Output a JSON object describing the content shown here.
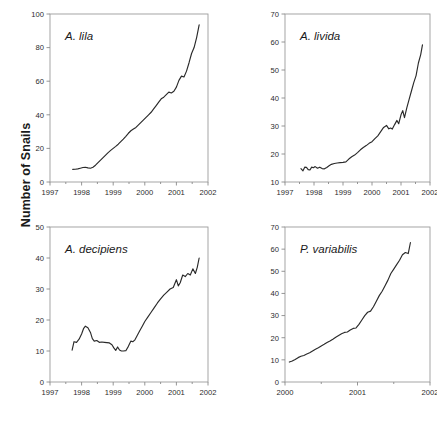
{
  "figure": {
    "shared_y_axis_label": "Number of Snails",
    "background_color": "#ffffff",
    "line_color": "#2a2a2a",
    "frame_color": "#9b9b9b"
  },
  "chart_data": [
    {
      "type": "line",
      "title": "A. lila",
      "panel": "top-left",
      "xlabel": "",
      "ylabel": "Number of Snails",
      "xlim": [
        1997,
        2002
      ],
      "ylim": [
        0,
        100
      ],
      "xticks": [
        1997,
        1998,
        1999,
        2000,
        2001,
        2002
      ],
      "xticklabels": [
        "1997",
        "1998",
        "1999",
        "2000",
        "2001",
        "2002"
      ],
      "yticks": [
        0,
        20,
        40,
        60,
        80,
        100
      ],
      "yticklabels": [
        "0",
        "20",
        "40",
        "60",
        "80",
        "100"
      ],
      "grid": false,
      "legend": "none",
      "x": [
        1997.72,
        1997.8,
        1997.88,
        1997.96,
        1998.04,
        1998.12,
        1998.2,
        1998.28,
        1998.36,
        1998.44,
        1998.52,
        1998.6,
        1998.68,
        1998.76,
        1998.84,
        1998.92,
        1999.0,
        1999.08,
        1999.16,
        1999.24,
        1999.32,
        1999.4,
        1999.48,
        1999.56,
        1999.64,
        1999.72,
        1999.8,
        1999.88,
        1999.96,
        2000.04,
        2000.12,
        2000.2,
        2000.28,
        2000.36,
        2000.44,
        2000.52,
        2000.6,
        2000.68,
        2000.76,
        2000.84,
        2000.92,
        2001.0,
        2001.08,
        2001.16,
        2001.24,
        2001.32,
        2001.4,
        2001.48,
        2001.56,
        2001.64,
        2001.72
      ],
      "y": [
        7.5,
        7.6,
        7.8,
        8.2,
        8.6,
        8.8,
        8.4,
        8.2,
        8.8,
        10.0,
        11.5,
        13.0,
        14.5,
        16.0,
        17.5,
        18.8,
        20.0,
        21.2,
        22.5,
        24.0,
        25.5,
        27.2,
        29.0,
        30.5,
        31.5,
        32.5,
        34.0,
        35.5,
        37.0,
        38.5,
        40.0,
        41.5,
        43.5,
        45.5,
        47.5,
        49.5,
        50.5,
        52.0,
        53.5,
        53.0,
        54.0,
        56.5,
        60.5,
        63.0,
        62.5,
        66.0,
        71.0,
        76.5,
        80.0,
        86.0,
        93.5
      ]
    },
    {
      "type": "line",
      "title": "A. livida",
      "panel": "top-right",
      "xlabel": "",
      "ylabel": "Number of Snails",
      "xlim": [
        1997,
        2002
      ],
      "ylim": [
        10,
        70
      ],
      "xticks": [
        1997,
        1998,
        1999,
        2000,
        2001,
        2002
      ],
      "xticklabels": [
        "1997",
        "1998",
        "1999",
        "2000",
        "2001",
        "2002"
      ],
      "yticks": [
        10,
        20,
        30,
        40,
        50,
        60,
        70
      ],
      "yticklabels": [
        "10",
        "20",
        "30",
        "40",
        "50",
        "60",
        "70"
      ],
      "grid": false,
      "legend": "none",
      "x": [
        1997.55,
        1997.62,
        1997.68,
        1997.74,
        1997.8,
        1997.86,
        1997.92,
        1997.98,
        1998.04,
        1998.12,
        1998.2,
        1998.28,
        1998.36,
        1998.44,
        1998.52,
        1998.6,
        1998.7,
        1998.8,
        1998.9,
        1999.0,
        1999.1,
        1999.2,
        1999.3,
        1999.4,
        1999.5,
        1999.6,
        1999.7,
        1999.8,
        1999.9,
        2000.0,
        2000.1,
        2000.2,
        2000.3,
        2000.4,
        2000.5,
        2000.58,
        2000.64,
        2000.7,
        2000.78,
        2000.86,
        2000.92,
        2001.0,
        2001.06,
        2001.12,
        2001.2,
        2001.28,
        2001.36,
        2001.44,
        2001.52,
        2001.6,
        2001.68,
        2001.74
      ],
      "y": [
        14.8,
        14.0,
        15.3,
        15.2,
        14.4,
        14.3,
        15.3,
        15.1,
        15.5,
        14.9,
        15.3,
        14.8,
        14.7,
        15.2,
        15.8,
        16.3,
        16.6,
        16.8,
        16.9,
        17.0,
        17.2,
        18.2,
        19.0,
        19.6,
        20.5,
        21.5,
        22.3,
        23.0,
        23.8,
        24.4,
        25.5,
        26.5,
        28.0,
        29.5,
        30.2,
        29.0,
        29.3,
        28.9,
        30.5,
        32.0,
        30.8,
        34.0,
        35.5,
        33.0,
        36.5,
        39.5,
        42.5,
        45.5,
        48.0,
        52.5,
        55.5,
        59.0
      ]
    },
    {
      "type": "line",
      "title": "A. decipiens",
      "panel": "bottom-left",
      "xlabel": "",
      "ylabel": "Number of Snails",
      "xlim": [
        1997,
        2002
      ],
      "ylim": [
        0,
        50
      ],
      "xticks": [
        1997,
        1998,
        1999,
        2000,
        2001,
        2002
      ],
      "xticklabels": [
        "1997",
        "1998",
        "1999",
        "2000",
        "2001",
        "2002"
      ],
      "yticks": [
        0,
        10,
        20,
        30,
        40,
        50
      ],
      "yticklabels": [
        "0",
        "10",
        "20",
        "30",
        "40",
        "50"
      ],
      "grid": false,
      "legend": "none",
      "x": [
        1997.7,
        1997.76,
        1997.84,
        1997.92,
        1998.0,
        1998.06,
        1998.12,
        1998.2,
        1998.28,
        1998.34,
        1998.4,
        1998.48,
        1998.56,
        1998.64,
        1998.72,
        1998.8,
        1998.88,
        1998.96,
        1999.02,
        1999.08,
        1999.14,
        1999.2,
        1999.26,
        1999.32,
        1999.4,
        1999.48,
        1999.56,
        1999.62,
        1999.68,
        1999.76,
        1999.84,
        1999.92,
        2000.0,
        2000.1,
        2000.2,
        2000.3,
        2000.4,
        2000.5,
        2000.6,
        2000.7,
        2000.8,
        2000.9,
        2001.0,
        2001.06,
        2001.12,
        2001.2,
        2001.28,
        2001.36,
        2001.44,
        2001.52,
        2001.6,
        2001.66,
        2001.72
      ],
      "y": [
        10.3,
        13.0,
        12.8,
        13.8,
        15.5,
        17.2,
        18.0,
        17.5,
        16.0,
        14.0,
        13.2,
        13.4,
        12.8,
        12.9,
        12.8,
        12.7,
        12.6,
        12.0,
        11.0,
        10.2,
        11.3,
        10.3,
        10.0,
        10.0,
        10.1,
        11.5,
        13.2,
        13.0,
        13.5,
        15.0,
        16.5,
        18.0,
        19.5,
        21.0,
        22.5,
        24.0,
        25.5,
        26.8,
        28.0,
        29.0,
        30.0,
        30.5,
        33.0,
        31.0,
        32.0,
        34.5,
        34.0,
        35.0,
        34.5,
        36.5,
        35.0,
        37.0,
        40.0
      ]
    },
    {
      "type": "line",
      "title": "P. variabilis",
      "panel": "bottom-right",
      "xlabel": "",
      "ylabel": "Number of Snails",
      "xlim": [
        2000,
        2002
      ],
      "ylim": [
        0,
        70
      ],
      "xticks": [
        2000,
        2001,
        2002
      ],
      "xticklabels": [
        "2000",
        "2001",
        "2002"
      ],
      "yticks": [
        0,
        10,
        20,
        30,
        40,
        50,
        60,
        70
      ],
      "yticklabels": [
        "0",
        "10",
        "20",
        "30",
        "40",
        "50",
        "60",
        "70"
      ],
      "grid": false,
      "legend": "none",
      "x": [
        2000.06,
        2000.1,
        2000.14,
        2000.18,
        2000.22,
        2000.26,
        2000.3,
        2000.34,
        2000.38,
        2000.42,
        2000.46,
        2000.5,
        2000.54,
        2000.58,
        2000.62,
        2000.66,
        2000.7,
        2000.74,
        2000.78,
        2000.82,
        2000.86,
        2000.9,
        2000.94,
        2000.98,
        2001.02,
        2001.06,
        2001.1,
        2001.14,
        2001.18,
        2001.22,
        2001.26,
        2001.3,
        2001.34,
        2001.38,
        2001.42,
        2001.46,
        2001.5,
        2001.54,
        2001.58,
        2001.62,
        2001.66,
        2001.7,
        2001.73
      ],
      "y": [
        9.0,
        9.5,
        10.2,
        11.0,
        11.6,
        12.0,
        12.6,
        13.2,
        14.0,
        14.8,
        15.5,
        16.3,
        17.0,
        17.8,
        18.5,
        19.3,
        20.2,
        21.0,
        21.8,
        22.4,
        22.6,
        23.5,
        24.2,
        24.4,
        26.0,
        28.0,
        30.0,
        31.5,
        32.0,
        34.0,
        36.5,
        39.0,
        41.0,
        43.5,
        46.0,
        49.0,
        51.0,
        53.0,
        55.0,
        57.5,
        58.5,
        58.0,
        63.0
      ]
    }
  ]
}
